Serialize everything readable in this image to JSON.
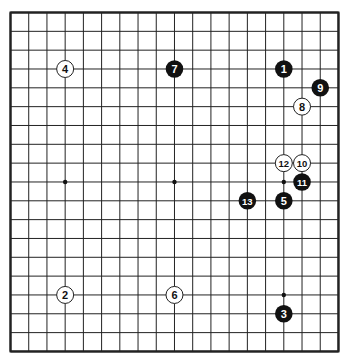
{
  "board": {
    "size": 19,
    "origin": {
      "x": 10.5,
      "y": 12.5
    },
    "spacing": {
      "x": 18.22,
      "y": 18.83
    },
    "line_color": "#222222",
    "border_width": 2,
    "line_width": 1,
    "background": "#ffffff"
  },
  "star_points": [
    {
      "col": 3,
      "row": 9
    },
    {
      "col": 9,
      "row": 9
    },
    {
      "col": 15,
      "row": 9
    },
    {
      "col": 15,
      "row": 15
    }
  ],
  "stones": [
    {
      "number": "1",
      "color": "black",
      "col": 15,
      "row": 3
    },
    {
      "number": "2",
      "color": "white",
      "col": 3,
      "row": 15
    },
    {
      "number": "3",
      "color": "black",
      "col": 15,
      "row": 16
    },
    {
      "number": "4",
      "color": "white",
      "col": 3,
      "row": 3
    },
    {
      "number": "5",
      "color": "black",
      "col": 15,
      "row": 10
    },
    {
      "number": "6",
      "color": "white",
      "col": 9,
      "row": 15
    },
    {
      "number": "7",
      "color": "black",
      "col": 9,
      "row": 3
    },
    {
      "number": "8",
      "color": "white",
      "col": 16,
      "row": 5
    },
    {
      "number": "9",
      "color": "black",
      "col": 17,
      "row": 4
    },
    {
      "number": "10",
      "color": "white",
      "col": 16,
      "row": 8
    },
    {
      "number": "11",
      "color": "black",
      "col": 16,
      "row": 9
    },
    {
      "number": "12",
      "color": "white",
      "col": 15,
      "row": 8
    },
    {
      "number": "13",
      "color": "black",
      "col": 13,
      "row": 10
    }
  ],
  "colors": {
    "black_stone": "#111111",
    "white_stone": "#ffffff",
    "white_stone_border": "#222222",
    "black_label": "#ffffff",
    "white_label": "#111111"
  }
}
